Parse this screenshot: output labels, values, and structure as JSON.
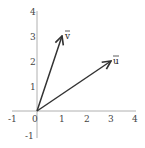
{
  "diagram": {
    "type": "vector-plot",
    "axes": {
      "x_range": [
        -1,
        4
      ],
      "y_range": [
        -1,
        4
      ],
      "x_ticks": [
        "-1",
        "0",
        "1",
        "2",
        "3",
        "4"
      ],
      "y_ticks": [
        "-1",
        "1",
        "2",
        "3",
        "4"
      ],
      "origin_label": "0",
      "axis_color": "#b0b0b0"
    },
    "vectors": [
      {
        "name": "u",
        "label": "u",
        "from": [
          0,
          0
        ],
        "to": [
          3,
          2
        ],
        "color": "#333333"
      },
      {
        "name": "v",
        "label": "v",
        "from": [
          0,
          0
        ],
        "to": [
          1,
          3
        ],
        "color": "#333333"
      }
    ]
  }
}
